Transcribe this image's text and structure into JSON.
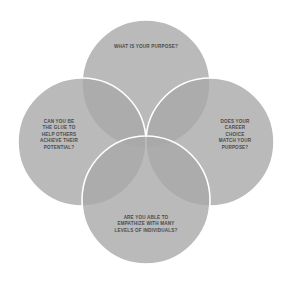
{
  "diagram": {
    "type": "venn",
    "set_count": 4,
    "background_color": "#ffffff",
    "circle_fill_color": "#a9a9a9",
    "circle_overlap_color": "#8c8c8c",
    "circle_stroke_color": "#ffffff",
    "text_color": "#4a4a4a",
    "circles": [
      {
        "id": "top",
        "position": "top",
        "cx": 146,
        "cy": 84,
        "r": 64,
        "lines": [
          "WHAT IS YOUR PURPOSE?"
        ]
      },
      {
        "id": "left",
        "position": "left",
        "cx": 82,
        "cy": 142,
        "r": 64,
        "lines": [
          "CAN YOU BE",
          "THE GLUE TO",
          "HELP OTHERS",
          "ACHIEVE THEIR",
          "POTENTIAL?"
        ]
      },
      {
        "id": "right",
        "position": "right",
        "cx": 210,
        "cy": 142,
        "r": 64,
        "lines": [
          "DOES YOUR",
          "CAREER",
          "CHOICE",
          "MATCH YOUR",
          "PURPOSE?"
        ]
      },
      {
        "id": "bottom",
        "position": "bottom",
        "cx": 146,
        "cy": 200,
        "r": 64,
        "lines": [
          "ARE YOU ABLE TO",
          "EMPATHIZE WITH MANY",
          "LEVELS OF INDIVIDUALS?"
        ]
      }
    ]
  }
}
